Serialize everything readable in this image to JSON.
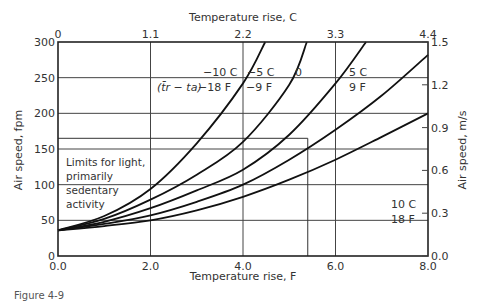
{
  "chart_data": {
    "type": "line",
    "title": "",
    "xlabel": "Temperature rise, F",
    "ylabel": "Air speed, fpm",
    "x2label": "Temperature rise, C",
    "y2label": "Air speed, m/s",
    "xlim": [
      0,
      8
    ],
    "ylim": [
      0,
      300
    ],
    "x_ticks": [
      "0.0",
      "2.0",
      "4.0",
      "6.0",
      "8.0"
    ],
    "x_tick_values": [
      0,
      2,
      4,
      6,
      8
    ],
    "y_ticks": [
      "0",
      "50",
      "100",
      "150",
      "200",
      "250",
      "300"
    ],
    "y_tick_values": [
      0,
      50,
      100,
      150,
      200,
      250,
      300
    ],
    "x2_ticks": [
      "0",
      "1.1",
      "2.2",
      "3.3",
      "4.4"
    ],
    "y2_ticks": [
      "0.0",
      "0.3",
      "0.6",
      "0.9",
      "1.2",
      "1.5"
    ],
    "grid": true,
    "legend_position": "inline annotations",
    "series_header": "(t̄r − ta)",
    "series": [
      {
        "name": "−10 C / −18 F",
        "label_c": "−10 C",
        "label_f": "−18 F",
        "x": [
          0,
          1,
          2,
          3,
          4,
          4.48
        ],
        "y": [
          36,
          56,
          94,
          158,
          242,
          300
        ]
      },
      {
        "name": "−5 C / −9 F",
        "label_c": "−5 C",
        "label_f": "−9 F",
        "x": [
          0,
          1,
          2,
          3,
          4,
          5,
          5.38
        ],
        "y": [
          36,
          52,
          79,
          114,
          160,
          240,
          300
        ]
      },
      {
        "name": "0",
        "label_c": "0",
        "label_f": "",
        "x": [
          0,
          1,
          2,
          3,
          4,
          5,
          6,
          6.66
        ],
        "y": [
          36,
          48,
          67,
          92,
          121,
          170,
          242,
          300
        ]
      },
      {
        "name": "5 C / 9 F",
        "label_c": "5 C",
        "label_f": "9 F",
        "x": [
          0,
          1,
          2,
          3,
          4,
          5,
          6,
          7,
          8
        ],
        "y": [
          36,
          45,
          57,
          76,
          100,
          135,
          177,
          225,
          282
        ]
      },
      {
        "name": "10 C / 18 F",
        "label_c": "10 C",
        "label_f": "18 F",
        "x": [
          0,
          1,
          2,
          3,
          4,
          5,
          6,
          7,
          8
        ],
        "y": [
          36,
          42,
          50,
          64,
          83,
          107,
          135,
          167,
          200
        ]
      }
    ],
    "annotations": [
      {
        "text": "Limits for light, primarily sedentary activity",
        "lines": [
          "Limits for light,",
          "primarily",
          "sedentary",
          "activity"
        ],
        "limit_box": {
          "x_max": 5.4,
          "y_max": 165
        }
      }
    ]
  },
  "caption_fragment": "Figure 4-9"
}
